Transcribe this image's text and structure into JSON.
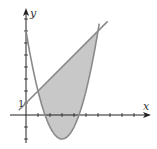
{
  "chart_data": {
    "type": "area",
    "title": "",
    "xlabel": "x",
    "ylabel": "y",
    "xlim": [
      -1.1,
      10.2
    ],
    "ylim": [
      -2.3,
      8.8
    ],
    "grid": false,
    "ticks": {
      "x_step": 1,
      "y_step": 1,
      "y_labeled": [
        {
          "value": 1,
          "label": "1"
        }
      ]
    },
    "series": [
      {
        "name": "parabola",
        "equation": "y = x^2 - 6x + 7",
        "x_range": [
          0,
          6.1
        ],
        "color": "#8a8a8a"
      },
      {
        "name": "line",
        "equation": "y = x + 1",
        "x_range": [
          -0.6,
          6.8
        ],
        "color": "#8a8a8a"
      }
    ],
    "shaded_region": {
      "between": [
        "line",
        "parabola"
      ],
      "x_range": [
        1,
        6
      ],
      "fill": "#c8c8c8"
    },
    "intersections": [
      [
        1,
        2
      ],
      [
        6,
        7
      ]
    ]
  },
  "labels": {
    "x_axis": "x",
    "y_axis": "y",
    "y_tick_1": "1"
  },
  "colors": {
    "axis": "#222222",
    "curve": "#8a8a8a",
    "fill": "#c8c8c8"
  }
}
